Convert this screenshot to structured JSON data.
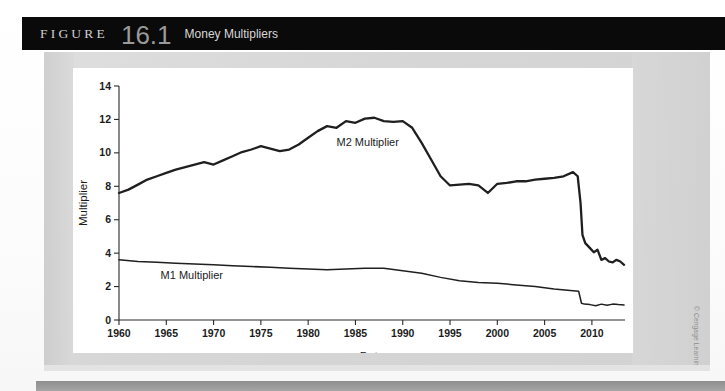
{
  "header": {
    "figure_word": "FIGURE",
    "figure_number": "16.1",
    "figure_title": "Money Multipliers",
    "background_color": "#0a0a0a"
  },
  "credit": {
    "text": "© Cengage Learning"
  },
  "chart_data": {
    "type": "line",
    "title": "Money Multipliers",
    "xlabel": "Date",
    "ylabel": "Multiplier",
    "xlim": [
      1960,
      2013.5
    ],
    "ylim": [
      0,
      14
    ],
    "xticks": [
      1960,
      1965,
      1970,
      1975,
      1980,
      1985,
      1990,
      1995,
      2000,
      2005,
      2010
    ],
    "yticks": [
      0,
      2,
      4,
      6,
      8,
      10,
      12,
      14
    ],
    "grid": false,
    "legend_position": "inline-annotation",
    "annotations": [
      {
        "text": "M2 Multiplier",
        "x": 1983.0,
        "y": 10.4
      },
      {
        "text": "M1 Multiplier",
        "x": 1964.4,
        "y": 2.45
      }
    ],
    "series": [
      {
        "name": "M2 Multiplier",
        "color": "#1f1f1f",
        "x": [
          1960,
          1961,
          1962,
          1963,
          1964,
          1965,
          1966,
          1967,
          1968,
          1969,
          1970,
          1971,
          1972,
          1973,
          1974,
          1975,
          1976,
          1977,
          1978,
          1979,
          1980,
          1981,
          1982,
          1983,
          1984,
          1985,
          1986,
          1987,
          1988,
          1989,
          1990,
          1991,
          1992,
          1993,
          1994,
          1995,
          1996,
          1997,
          1998,
          1999,
          2000,
          2001,
          2002,
          2003,
          2004,
          2005,
          2006,
          2007,
          2008,
          2008.5,
          2008.8,
          2009,
          2009.3,
          2009.8,
          2010.2,
          2010.6,
          2011,
          2011.4,
          2011.8,
          2012.2,
          2012.6,
          2013,
          2013.4
        ],
        "values": [
          7.6,
          7.8,
          8.1,
          8.4,
          8.6,
          8.8,
          9.0,
          9.15,
          9.3,
          9.45,
          9.3,
          9.55,
          9.8,
          10.05,
          10.2,
          10.4,
          10.25,
          10.1,
          10.2,
          10.5,
          10.9,
          11.3,
          11.6,
          11.5,
          11.9,
          11.8,
          12.05,
          12.1,
          11.9,
          11.85,
          11.9,
          11.5,
          10.6,
          9.6,
          8.6,
          8.05,
          8.1,
          8.15,
          8.05,
          7.6,
          8.15,
          8.2,
          8.3,
          8.3,
          8.4,
          8.45,
          8.5,
          8.6,
          8.85,
          8.6,
          7.0,
          5.1,
          4.6,
          4.3,
          4.05,
          4.2,
          3.6,
          3.7,
          3.5,
          3.45,
          3.6,
          3.5,
          3.3
        ]
      },
      {
        "name": "M1 Multiplier",
        "color": "#1f1f1f",
        "x": [
          1960,
          1962,
          1964,
          1966,
          1968,
          1970,
          1972,
          1974,
          1976,
          1978,
          1980,
          1982,
          1984,
          1986,
          1988,
          1990,
          1992,
          1994,
          1996,
          1998,
          2000,
          2002,
          2004,
          2006,
          2008,
          2008.6,
          2008.9,
          2009.2,
          2009.8,
          2010.4,
          2011,
          2011.6,
          2012.2,
          2012.8,
          2013.4
        ],
        "values": [
          3.6,
          3.5,
          3.45,
          3.4,
          3.35,
          3.3,
          3.25,
          3.2,
          3.15,
          3.1,
          3.05,
          3.0,
          3.05,
          3.1,
          3.1,
          2.95,
          2.8,
          2.55,
          2.35,
          2.25,
          2.2,
          2.1,
          2.0,
          1.85,
          1.75,
          1.72,
          1.0,
          0.95,
          0.92,
          0.85,
          0.95,
          0.88,
          0.95,
          0.92,
          0.9
        ]
      }
    ]
  }
}
